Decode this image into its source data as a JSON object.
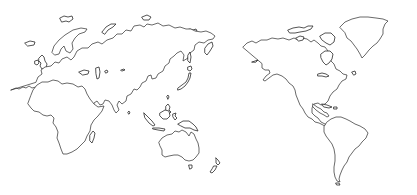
{
  "map": {
    "projection": "pacific-centered-world",
    "style": "outline",
    "colors": {
      "background": "#ffffff",
      "coastline": "#2a2a2a"
    },
    "regions": [
      {
        "name": "Africa"
      },
      {
        "name": "Europe"
      },
      {
        "name": "Asia"
      },
      {
        "name": "Australia"
      },
      {
        "name": "New Zealand"
      },
      {
        "name": "North America"
      },
      {
        "name": "Greenland"
      },
      {
        "name": "South America"
      }
    ]
  }
}
